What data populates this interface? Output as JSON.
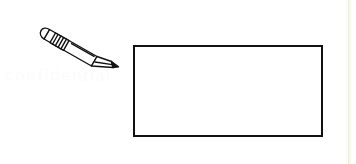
{
  "page": {
    "background_color": "#ffffff",
    "width": 356,
    "height": 164,
    "media": "scanned worksheet page"
  },
  "watermark": {
    "text": "confidential",
    "color": "#8c8c8c",
    "opacity": "0.035",
    "visible": "barely visible ghost text"
  },
  "page_edge": {
    "name": "scan edge strip",
    "color": "#f4f6e6",
    "line_color": "#eef0dd",
    "position": "right"
  },
  "illustration": {
    "pencil": {
      "icon": "pencil-icon",
      "label": "pencil",
      "orientation": "angled down-right about 30 degrees",
      "outline_color": "#111111",
      "body_fill": "#ffffff",
      "tip_fill": "#111111",
      "parts": [
        {
          "name": "eraser-cap",
          "label": "eraser"
        },
        {
          "name": "ferrule",
          "label": "metal ferrule",
          "ring_count": 4
        },
        {
          "name": "barrel",
          "label": "wooden barrel"
        },
        {
          "name": "sharpened-cone",
          "label": "sharpened wood cone"
        },
        {
          "name": "graphite-tip",
          "label": "graphite point"
        }
      ]
    },
    "answer_box": {
      "name": "answer-box",
      "label": "blank answer box",
      "border_color": "#111111",
      "border_width_px": 2,
      "fill": "#ffffff",
      "content": "",
      "left": 133,
      "top": 45,
      "width": 190,
      "height": 92
    }
  }
}
